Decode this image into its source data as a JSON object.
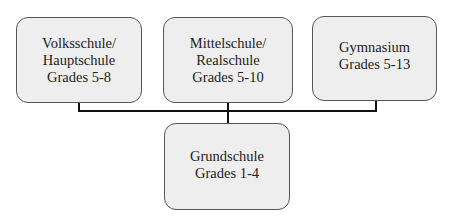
{
  "diagram": {
    "type": "hierarchy",
    "nodes": [
      {
        "id": "volksschule",
        "lines": [
          "Volksschule/",
          "Hauptschule",
          "Grades 5-8"
        ]
      },
      {
        "id": "mittelschule",
        "lines": [
          "Mittelschule/",
          "Realschule",
          "Grades 5-10"
        ]
      },
      {
        "id": "gymnasium",
        "lines": [
          "Gymnasium",
          "Grades 5-13"
        ]
      },
      {
        "id": "grundschule",
        "lines": [
          "Grundschule",
          "Grades 1-4"
        ]
      }
    ],
    "edges": [
      {
        "from": "grundschule",
        "to": "volksschule"
      },
      {
        "from": "grundschule",
        "to": "mittelschule"
      },
      {
        "from": "grundschule",
        "to": "gymnasium"
      }
    ]
  }
}
